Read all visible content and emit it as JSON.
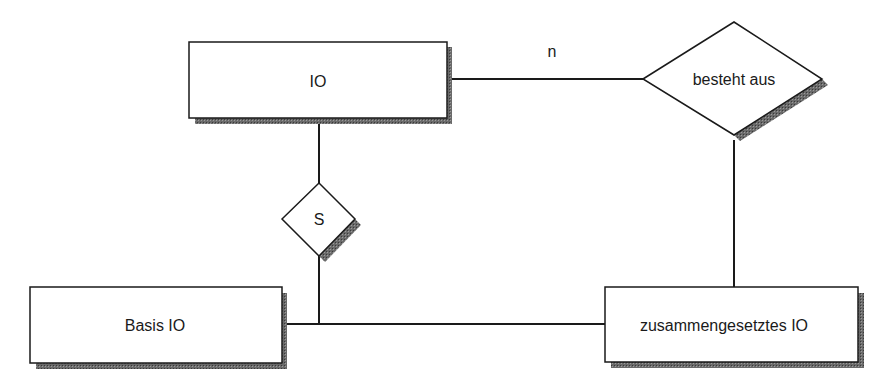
{
  "diagram": {
    "type": "entity-relationship",
    "entities": [
      {
        "id": "io",
        "label": "IO"
      },
      {
        "id": "basis_io",
        "label": "Basis IO"
      },
      {
        "id": "zusammengesetztes_io",
        "label": "zusammengesetztes IO"
      }
    ],
    "relationships": [
      {
        "id": "besteht_aus",
        "label": "besteht aus"
      },
      {
        "id": "specialization",
        "label": "S"
      }
    ],
    "cardinalities": {
      "io_to_besteht_aus": "n",
      "besteht_aus_to_zusammengesetztes": "n"
    },
    "edges": [
      {
        "from": "io",
        "to": "besteht_aus",
        "cardinality": "n"
      },
      {
        "from": "besteht_aus",
        "to": "zusammengesetztes_io",
        "cardinality": "n"
      },
      {
        "from": "io",
        "to": "specialization"
      },
      {
        "from": "specialization",
        "to": "basis_io"
      },
      {
        "from": "specialization",
        "to": "zusammengesetztes_io"
      }
    ]
  },
  "colors": {
    "line": "#1a1a1a",
    "shadow": "#555555",
    "fill": "#ffffff"
  }
}
